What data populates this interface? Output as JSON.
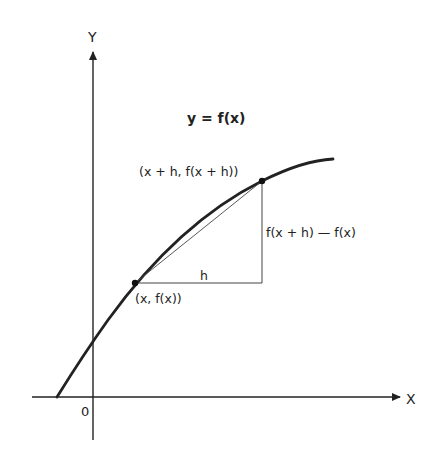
{
  "diagram": {
    "title": "y = f(x)",
    "axes": {
      "x_label": "X",
      "y_label": "Y",
      "origin_label": "0"
    },
    "points": [
      {
        "label": "(x, f(x))"
      },
      {
        "label": "(x + h, f(x + h))"
      }
    ],
    "labels": {
      "horizontal_leg": "h",
      "vertical_leg": "f(x + h) — f(x)"
    },
    "colors": {
      "ink": "#222222",
      "background": "#ffffff"
    }
  }
}
